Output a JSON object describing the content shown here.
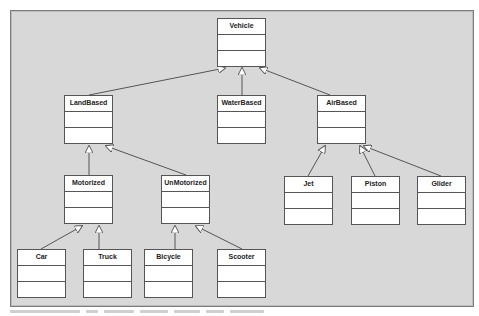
{
  "diagram": {
    "type": "UML class hierarchy",
    "colors": {
      "background": "#d8d8d8",
      "box_fill": "#ffffff",
      "stroke": "#555555",
      "text": "#222222"
    },
    "classes": [
      {
        "id": "vehicle",
        "name": "Vehicle",
        "x": 217,
        "y": 18,
        "parent": null
      },
      {
        "id": "landbased",
        "name": "LandBased",
        "x": 64,
        "y": 95,
        "parent": "vehicle"
      },
      {
        "id": "waterbased",
        "name": "WaterBased",
        "x": 217,
        "y": 95,
        "parent": "vehicle"
      },
      {
        "id": "airbased",
        "name": "AirBased",
        "x": 317,
        "y": 95,
        "parent": "vehicle"
      },
      {
        "id": "motorized",
        "name": "Motorized",
        "x": 64,
        "y": 175,
        "parent": "landbased"
      },
      {
        "id": "unmotorized",
        "name": "UnMotorized",
        "x": 161,
        "y": 175,
        "parent": "landbased"
      },
      {
        "id": "jet",
        "name": "Jet",
        "x": 284,
        "y": 176,
        "parent": "airbased"
      },
      {
        "id": "piston",
        "name": "Piston",
        "x": 351,
        "y": 176,
        "parent": "airbased"
      },
      {
        "id": "glider",
        "name": "Glider",
        "x": 417,
        "y": 176,
        "parent": "airbased"
      },
      {
        "id": "car",
        "name": "Car",
        "x": 17,
        "y": 249,
        "parent": "motorized"
      },
      {
        "id": "truck",
        "name": "Truck",
        "x": 83,
        "y": 249,
        "parent": "motorized"
      },
      {
        "id": "bicycle",
        "name": "Bicycle",
        "x": 144,
        "y": 249,
        "parent": "unmotorized"
      },
      {
        "id": "scooter",
        "name": "Scooter",
        "x": 217,
        "y": 249,
        "parent": "unmotorized"
      }
    ]
  }
}
